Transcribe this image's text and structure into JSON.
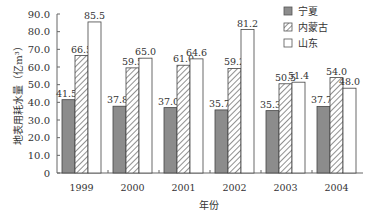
{
  "chart_data": {
    "type": "bar",
    "title": "",
    "xlabel": "年份",
    "ylabel": "地表用耗水量（亿m³）",
    "categories": [
      "1999",
      "2000",
      "2001",
      "2002",
      "2003",
      "2004"
    ],
    "series": [
      {
        "name": "宁夏",
        "pattern": "solid-gray",
        "values": [
          41.5,
          37.8,
          37.0,
          35.7,
          35.3,
          37.7
        ]
      },
      {
        "name": "内蒙古",
        "pattern": "hatched",
        "values": [
          66.5,
          59.5,
          61.0,
          59.2,
          50.5,
          54.0
        ]
      },
      {
        "name": "山东",
        "pattern": "white",
        "values": [
          85.5,
          65.0,
          64.6,
          81.2,
          51.4,
          48.0
        ]
      }
    ],
    "ylim": [
      0,
      90
    ],
    "yticks": [
      "0",
      "10.0",
      "20.0",
      "30.0",
      "40.0",
      "50.0",
      "60.0",
      "70.0",
      "80.0",
      "90.0"
    ],
    "grid": false,
    "legend_position": "top-right",
    "data_labels": true
  },
  "colors": {
    "solid": "#8c8c8c",
    "hatch": "#555555",
    "outline": "#444444"
  }
}
